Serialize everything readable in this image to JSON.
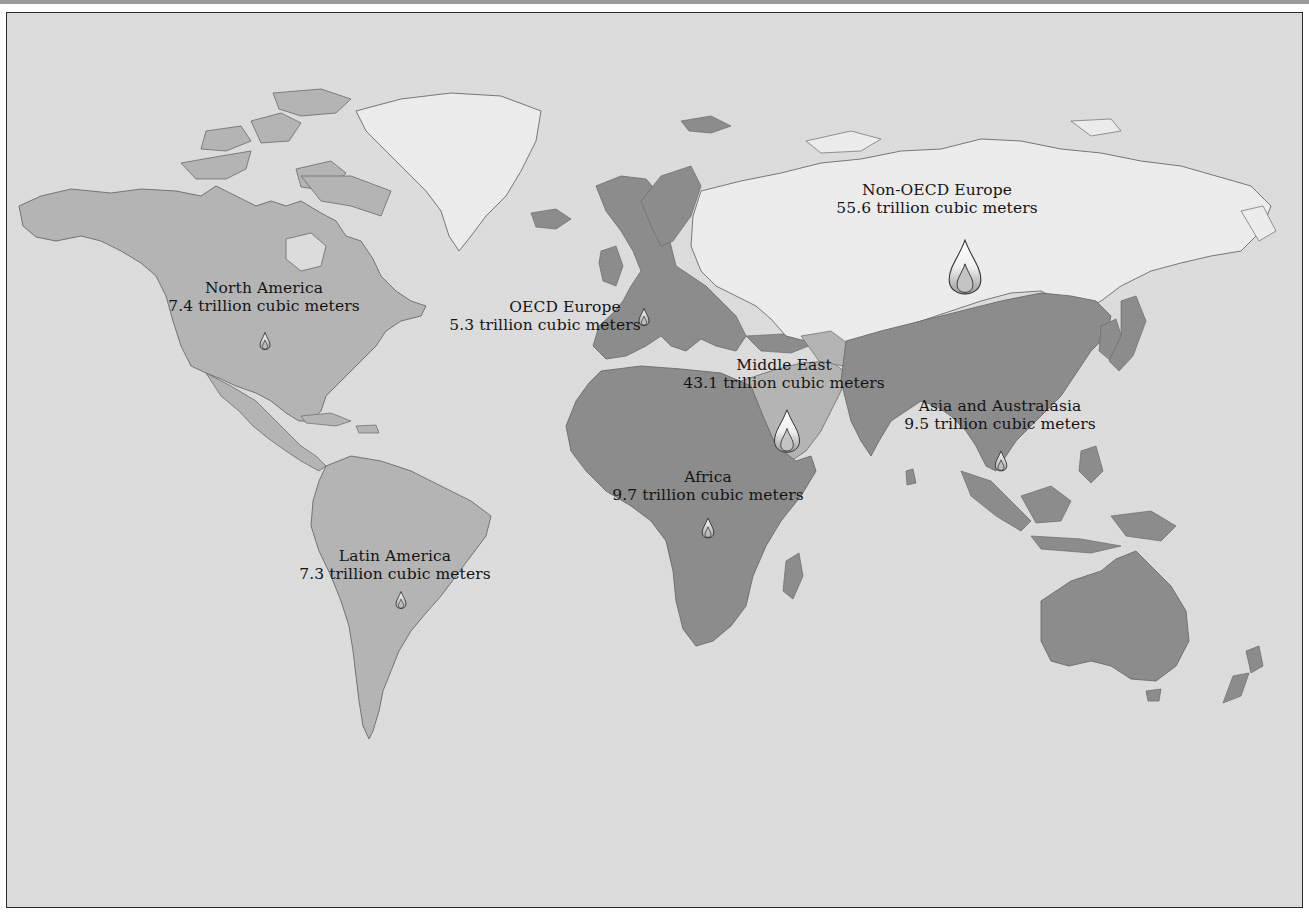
{
  "map": {
    "subject": "Natural gas reserves by region",
    "unit": "trillion cubic meters",
    "colors": {
      "ocean": "#dcdcdc",
      "light_region": "#ececec",
      "medium_region": "#b4b4b4",
      "dark_region": "#8c8c8c",
      "coastline": "#6a6a6a",
      "frame_border": "#2b2b2b",
      "text": "#141414"
    },
    "regions": [
      {
        "id": "north-america",
        "name": "North America",
        "value_text": "7.4 trillion cubic meters",
        "value": 7.4,
        "shade": "medium"
      },
      {
        "id": "oecd-europe",
        "name": "OECD Europe",
        "value_text": "5.3 trillion cubic meters",
        "value": 5.3,
        "shade": "dark"
      },
      {
        "id": "non-oecd-europe",
        "name": "Non-OECD Europe",
        "value_text": "55.6 trillion cubic meters",
        "value": 55.6,
        "shade": "light"
      },
      {
        "id": "middle-east",
        "name": "Middle East",
        "value_text": "43.1 trillion cubic meters",
        "value": 43.1,
        "shade": "medium"
      },
      {
        "id": "asia-australasia",
        "name": "Asia and Australasia",
        "value_text": "9.5 trillion cubic meters",
        "value": 9.5,
        "shade": "dark"
      },
      {
        "id": "africa",
        "name": "Africa",
        "value_text": "9.7 trillion cubic meters",
        "value": 9.7,
        "shade": "dark"
      },
      {
        "id": "latin-america",
        "name": "Latin America",
        "value_text": "7.3 trillion cubic meters",
        "value": 7.3,
        "shade": "medium"
      }
    ],
    "marker_icon": "flame-icon"
  }
}
